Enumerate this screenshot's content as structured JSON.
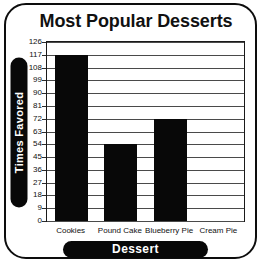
{
  "chart_data": {
    "type": "bar",
    "title": "Most Popular Desserts",
    "xlabel": "Dessert",
    "ylabel": "Times Favored",
    "categories": [
      "Cookies",
      "Pound Cake",
      "Blueberry Pie",
      "Cream Pie"
    ],
    "values": [
      117,
      54,
      72,
      0
    ],
    "ylim": [
      0,
      126
    ],
    "ytick_step": 9,
    "yticks": [
      126,
      117,
      108,
      99,
      90,
      81,
      72,
      63,
      54,
      45,
      36,
      27,
      18,
      9,
      0
    ],
    "ytick_labels": [
      "126",
      "117",
      "108",
      "99",
      "90",
      "81",
      "72",
      "63",
      "54",
      "45",
      "36",
      "27",
      "18",
      "9",
      "0"
    ],
    "grid": true,
    "legend": false,
    "bar_color": "#080808",
    "grid_color": "#4a4a4a",
    "axis_title_bg": "#080808",
    "axis_title_color": "#ffffff"
  }
}
